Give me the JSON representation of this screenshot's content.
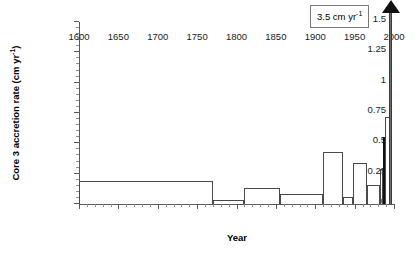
{
  "chart_data": {
    "type": "bar",
    "title": "",
    "xlabel": "Year",
    "ylabel_prefix": "Core 3 accretion rate (cm yr",
    "ylabel_sup": "-1",
    "ylabel_suffix": ")",
    "xlim": [
      1600,
      2000
    ],
    "ylim": [
      0,
      1.5
    ],
    "grid": false,
    "legend": null,
    "xticks": [
      1600,
      1650,
      1700,
      1750,
      1800,
      1850,
      1900,
      1950,
      2000
    ],
    "xtick_labels": [
      "1600",
      "1650",
      "1700",
      "1750",
      "1800",
      "1850",
      "1900",
      "1950",
      "2000"
    ],
    "xtick_minor_step": 10,
    "yticks": [
      0,
      0.25,
      0.5,
      0.75,
      1,
      1.25,
      1.5
    ],
    "ytick_labels": [
      "0",
      "0.25",
      "0.5",
      "0.75",
      "1",
      "1.25",
      "1.5"
    ],
    "ytick_minor_step": 0.05,
    "bar_style": "open-outline step histogram",
    "bars": [
      {
        "name": "1600-1770",
        "x_start": 1600,
        "x_end": 1770,
        "value": 0.19,
        "filled": false
      },
      {
        "name": "1770-1810",
        "x_start": 1770,
        "x_end": 1810,
        "value": 0.035,
        "filled": false
      },
      {
        "name": "1810-1855",
        "x_start": 1810,
        "x_end": 1855,
        "value": 0.135,
        "filled": false
      },
      {
        "name": "1855-1910",
        "x_start": 1855,
        "x_end": 1910,
        "value": 0.08,
        "filled": false
      },
      {
        "name": "1910-1935",
        "x_start": 1910,
        "x_end": 1935,
        "value": 0.425,
        "filled": false
      },
      {
        "name": "1935-1948",
        "x_start": 1935,
        "x_end": 1948,
        "value": 0.06,
        "filled": false
      },
      {
        "name": "1948-1966",
        "x_start": 1948,
        "x_end": 1966,
        "value": 0.335,
        "filled": false
      },
      {
        "name": "1966-1982",
        "x_start": 1966,
        "x_end": 1982,
        "value": 0.155,
        "filled": false
      },
      {
        "name": "1982-1986",
        "x_start": 1982,
        "x_end": 1986,
        "value": 0.29,
        "filled": false
      },
      {
        "name": "1986-1989",
        "x_start": 1986,
        "x_end": 1989,
        "value": 0.55,
        "filled": true
      },
      {
        "name": "1989-1996",
        "x_start": 1989,
        "x_end": 1996,
        "value": 0.72,
        "filled": false
      }
    ],
    "offscale_spike": {
      "name": "offscale-accretion-spike",
      "x_start": 1994,
      "x_end": 1998,
      "value": 3.5,
      "clipped_at": 1.5,
      "annotation": "3.5 cm yr",
      "annotation_sup": "-1"
    }
  },
  "colors": {
    "axis": "#5a5a5a",
    "bar_outline": "#4a4a4a",
    "bar_fill_solid": "#111111",
    "spike": "#6e6e6e",
    "annotation_border": "#7a7a7a",
    "background": "#ffffff",
    "text": "#1a1a1a"
  }
}
